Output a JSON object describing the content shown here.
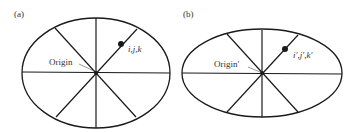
{
  "diagram": {
    "panels": [
      {
        "id": "a",
        "tag": "(a)",
        "origin_label": "Origin",
        "point_label": "i,j,k",
        "ellipse": {
          "cx": 96,
          "cy": 73,
          "rx": 74,
          "ry": 55
        }
      },
      {
        "id": "b",
        "tag": "(b)",
        "origin_label": "Origin′",
        "point_label": "i′,j′,k′",
        "ellipse": {
          "cx": 262,
          "cy": 73,
          "rx": 80,
          "ry": 45
        }
      }
    ],
    "colors": {
      "stroke": "#1a1a1a",
      "text": "#333333",
      "background": "#ffffff"
    }
  }
}
